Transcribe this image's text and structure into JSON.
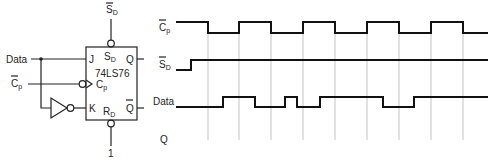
{
  "circuit": {
    "chip_label": "74LS76",
    "inputs": {
      "data": "Data",
      "clock": {
        "base": "C",
        "sub": "p",
        "overbar": true
      },
      "set_top": {
        "base": "S",
        "sub": "D",
        "overbar": true
      },
      "reset_value": "1"
    },
    "pins": {
      "J": "J",
      "K": "K",
      "Q": "Q",
      "Qbar": {
        "base": "Q",
        "overbar": true
      },
      "Cp": {
        "base": "C",
        "sub": "p"
      },
      "SD": {
        "base": "S",
        "sub": "D"
      },
      "RD": {
        "base": "R",
        "sub": "D"
      }
    },
    "components": [
      "inverter",
      "jk-flip-flop"
    ]
  },
  "timing": {
    "signals": [
      {
        "name": "Cp_bar",
        "label": {
          "base": "C",
          "sub": "p",
          "overbar": true
        },
        "transitions_x": [
          176,
          208,
          239,
          271,
          303,
          335,
          367,
          399,
          431,
          463,
          488
        ],
        "levels": [
          1,
          0,
          1,
          0,
          1,
          0,
          1,
          0,
          1,
          0
        ]
      },
      {
        "name": "SD_bar",
        "label": {
          "base": "S",
          "sub": "D",
          "overbar": true
        },
        "transitions_x": [
          176,
          191,
          488
        ],
        "levels": [
          0,
          1
        ]
      },
      {
        "name": "Data",
        "label": {
          "base": "Data"
        },
        "transitions_x": [
          176,
          223,
          255,
          285,
          297,
          320,
          383,
          414,
          488
        ],
        "levels": [
          0,
          1,
          0,
          1,
          0,
          1,
          0,
          1
        ]
      },
      {
        "name": "Q",
        "label": {
          "base": "Q"
        },
        "transitions_x": [],
        "levels": []
      }
    ],
    "clock_edge_markers_x": [
      208,
      239,
      271,
      303,
      335,
      367,
      399,
      431,
      463
    ]
  },
  "labels": {
    "data": "Data",
    "c": "C",
    "p": "p",
    "s": "S",
    "d": "D",
    "r": "R",
    "q": "Q",
    "j": "J",
    "k": "K",
    "chip": "74LS76",
    "one": "1"
  }
}
